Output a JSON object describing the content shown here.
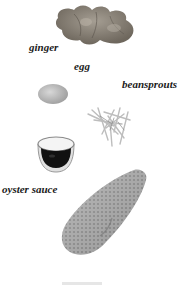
{
  "ingredients": [
    {
      "id": "ginger",
      "label": "ginger"
    },
    {
      "id": "egg",
      "label": "egg"
    },
    {
      "id": "beansprouts",
      "label": "beansprouts"
    },
    {
      "id": "oyster-sauce",
      "label": "oyster sauce"
    }
  ],
  "colors": {
    "background": "#ffffff",
    "label": "#1a1a1a",
    "ginger": "#8a8378",
    "egg": "#b8b8b8",
    "sauce": "#111111",
    "bowl": "#d6d6d6",
    "sprouts": "#cfcfcf",
    "main_item": "#a9a9a9"
  }
}
